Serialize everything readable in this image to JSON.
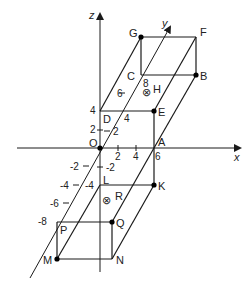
{
  "diagram": {
    "type": "3d-coordinate-cuboids",
    "axes": {
      "x": {
        "label": "x",
        "ticks": [
          "2",
          "4",
          "6"
        ]
      },
      "y": {
        "label": "y",
        "ticks": [
          "2",
          "4",
          "6",
          "8",
          "-2",
          "-4",
          "-6",
          "-8"
        ]
      },
      "z": {
        "label": "z",
        "ticks": [
          "2",
          "4",
          "-2",
          "-4"
        ]
      }
    },
    "labels": {
      "O": "O",
      "A": "A",
      "B": "B",
      "C": "C",
      "D": "D",
      "E": "E",
      "F": "F",
      "G": "G",
      "H": "H",
      "K": "K",
      "L": "L",
      "M": "M",
      "N": "N",
      "P": "P",
      "Q": "Q",
      "R": "R"
    },
    "tick_labels": {
      "x2": "2",
      "x4": "4",
      "x6": "6",
      "z4": "4",
      "z2": "2",
      "y2": "2",
      "y4": "4",
      "y6": "6",
      "y8": "8",
      "zneg2": "-2",
      "zneg4": "-4",
      "yneg2": "-2",
      "yneg4": "-4",
      "yneg6": "-6",
      "yneg8": "-8"
    },
    "markers": {
      "H": "⊗",
      "R": "⊗"
    },
    "line_color": "#1a1a1a",
    "point_color": "#000000"
  }
}
